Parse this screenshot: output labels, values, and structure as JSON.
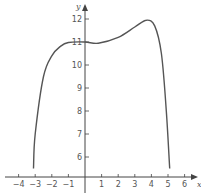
{
  "chart_data": {
    "type": "line",
    "title": "",
    "xlabel": "x",
    "ylabel": "y",
    "x_ticks": [
      -4,
      -3,
      -2,
      -1,
      1,
      2,
      3,
      4,
      5,
      6
    ],
    "x_tick_labels": [
      "−4",
      "−3",
      "−2",
      "−1",
      "1",
      "2",
      "3",
      "4",
      "5",
      "6"
    ],
    "y_ticks": [
      6,
      7,
      8,
      9,
      10,
      11,
      12
    ],
    "y_tick_labels": [
      "6",
      "7",
      "8",
      "9",
      "10",
      "11",
      "12"
    ],
    "xlim": [
      -4.8,
      6.8
    ],
    "ylim": [
      5.2,
      12.8
    ],
    "grid": false,
    "legend": null,
    "series": [
      {
        "name": "f(x)",
        "color": "#555555",
        "x": [
          -3.1,
          -3.0,
          -2.5,
          -2.0,
          -1.5,
          -1.0,
          0.0,
          0.8,
          2.0,
          3.0,
          3.7,
          4.2,
          4.6,
          4.9,
          5.1
        ],
        "y": [
          5.5,
          7.0,
          9.5,
          10.4,
          10.8,
          10.98,
          11.0,
          10.95,
          11.2,
          11.65,
          11.95,
          11.7,
          10.5,
          8.0,
          5.5
        ]
      }
    ]
  },
  "colors": {
    "axis": "#444444",
    "curve": "#555555",
    "background": "#ffffff"
  }
}
